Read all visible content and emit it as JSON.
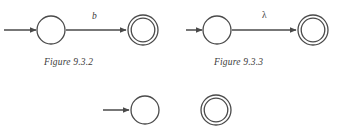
{
  "page": {
    "background_color": "#ffffff",
    "stroke_color": "#4a4a4a",
    "text_color": "#3a3a3a",
    "width": 343,
    "height": 133
  },
  "figures": [
    {
      "id": "figure-9-3-2",
      "caption": "Figure 9.3.2",
      "start_arrow": {
        "x1": 4,
        "y1": 30,
        "x2": 36,
        "y2": 30
      },
      "states": [
        {
          "name": "start-state",
          "type": "single",
          "cx": 51,
          "cy": 30,
          "r": 14
        },
        {
          "name": "accepting-state",
          "type": "double",
          "cx": 143,
          "cy": 30,
          "r_outer": 15,
          "r_inner": 12
        }
      ],
      "transition": {
        "label": "b",
        "label_style": "italic",
        "x1": 66,
        "y1": 30,
        "x2": 126,
        "y2": 30
      }
    },
    {
      "id": "figure-9-3-3",
      "caption": "Figure 9.3.3",
      "start_arrow": {
        "x1": 186,
        "y1": 30,
        "x2": 202,
        "y2": 30
      },
      "states": [
        {
          "name": "start-state",
          "type": "single",
          "cx": 217,
          "cy": 30,
          "r": 14
        },
        {
          "name": "accepting-state",
          "type": "double",
          "cx": 313,
          "cy": 30,
          "r_outer": 15,
          "r_inner": 12
        }
      ],
      "transition": {
        "label": "λ",
        "label_style": "normal",
        "x1": 232,
        "y1": 30,
        "x2": 296,
        "y2": 30
      }
    }
  ],
  "partial_row": {
    "id": "partial-figure-row",
    "start_arrow": {
      "x1": 103,
      "y1": 110,
      "x2": 129,
      "y2": 110
    },
    "states": [
      {
        "name": "start-state",
        "type": "single",
        "cx": 145,
        "cy": 110,
        "r": 14
      },
      {
        "name": "accepting-state",
        "type": "double",
        "cx": 216,
        "cy": 110,
        "r_outer": 15,
        "r_inner": 12
      }
    ]
  },
  "captions": {
    "figure_932": "Figure 9.3.2",
    "figure_933": "Figure 9.3.3"
  },
  "labels": {
    "edge_b": "b",
    "edge_lambda": "λ"
  }
}
